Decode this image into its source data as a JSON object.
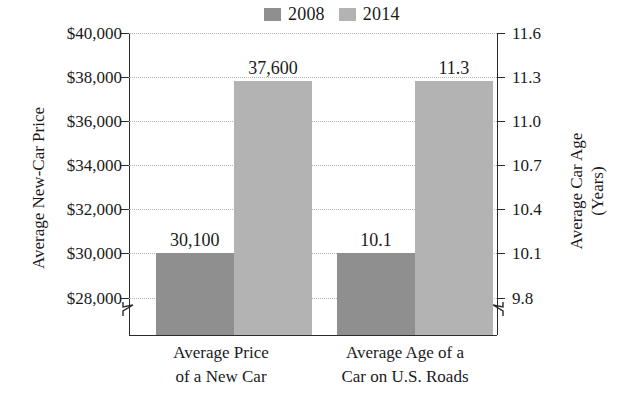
{
  "chart_data": {
    "type": "bar",
    "title": "",
    "categories": [
      "Average Price of a New Car",
      "Average Age of a Car on U.S. Roads"
    ],
    "series": [
      {
        "name": "2008",
        "color": "#8f8f8f",
        "values": [
          30100,
          10.1
        ],
        "labels": [
          "30,100",
          "10.1"
        ]
      },
      {
        "name": "2014",
        "color": "#b3b3b3",
        "values": [
          37600,
          11.3
        ],
        "labels": [
          "37,600",
          "11.3"
        ]
      }
    ],
    "left_axis": {
      "label": "Average New-Car Price",
      "ticks": [
        "$40,000",
        "$38,000",
        "$36,000",
        "$34,000",
        "$32,000",
        "$30,000",
        "$28,000"
      ],
      "values": [
        40000,
        38000,
        36000,
        34000,
        32000,
        30000,
        28000
      ],
      "ylim": [
        28000,
        40000
      ],
      "axis_break": true
    },
    "right_axis": {
      "label_line1": "Average Car Age",
      "label_line2": "(Years)",
      "ticks": [
        "11.6",
        "11.3",
        "11.0",
        "10.7",
        "10.4",
        "10.1",
        "9.8"
      ],
      "values": [
        11.6,
        11.3,
        11.0,
        10.7,
        10.4,
        10.1,
        9.8
      ],
      "ylim": [
        9.8,
        11.6
      ],
      "axis_break": true
    },
    "grid": true,
    "legend_position": "top-center"
  },
  "legend": {
    "entries": [
      {
        "label": "2008",
        "color": "#8f8f8f"
      },
      {
        "label": "2014",
        "color": "#b3b3b3"
      }
    ]
  },
  "axes": {
    "left": {
      "title": "Average New-Car Price",
      "ticks": [
        {
          "label": "$40,000",
          "pos_pct": 0
        },
        {
          "label": "$38,000",
          "pos_pct": 14.6
        },
        {
          "label": "$36,000",
          "pos_pct": 29.2
        },
        {
          "label": "$34,000",
          "pos_pct": 43.8
        },
        {
          "label": "$32,000",
          "pos_pct": 58.4
        },
        {
          "label": "$30,000",
          "pos_pct": 73.0
        },
        {
          "label": "$28,000",
          "pos_pct": 87.6
        }
      ]
    },
    "right": {
      "title_line1": "Average Car Age",
      "title_line2": "(Years)",
      "ticks": [
        {
          "label": "11.6",
          "pos_pct": 0
        },
        {
          "label": "11.3",
          "pos_pct": 14.6
        },
        {
          "label": "11.0",
          "pos_pct": 29.2
        },
        {
          "label": "10.7",
          "pos_pct": 43.8
        },
        {
          "label": "10.4",
          "pos_pct": 58.4
        },
        {
          "label": "10.1",
          "pos_pct": 73.0
        },
        {
          "label": "9.8",
          "pos_pct": 87.6
        }
      ]
    }
  },
  "categories": [
    {
      "line1": "Average Price",
      "line2": "of a New Car"
    },
    {
      "line1": "Average Age of a",
      "line2": "Car on U.S. Roads"
    }
  ],
  "bars": [
    {
      "name": "price-2008",
      "label": "30,100",
      "color": "#8f8f8f",
      "left_pct": 7.3,
      "width_pct": 21.2,
      "height_pct": 27.0
    },
    {
      "name": "price-2014",
      "label": "37,600",
      "color": "#b3b3b3",
      "left_pct": 28.5,
      "width_pct": 21.2,
      "height_pct": 84.0
    },
    {
      "name": "age-2008",
      "label": "10.1",
      "color": "#8f8f8f",
      "left_pct": 56.5,
      "width_pct": 21.2,
      "height_pct": 27.0
    },
    {
      "name": "age-2014",
      "label": "11.3",
      "color": "#b3b3b3",
      "left_pct": 77.7,
      "width_pct": 21.2,
      "height_pct": 84.0
    }
  ]
}
